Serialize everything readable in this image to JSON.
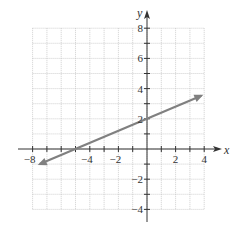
{
  "chart_data": {
    "type": "line",
    "title": "",
    "xlabel": "x",
    "ylabel": "y",
    "xlim": [
      -8,
      4
    ],
    "ylim": [
      -4,
      8
    ],
    "grid": true,
    "x_ticks": [
      -8,
      -4,
      -2,
      2,
      4
    ],
    "y_ticks": [
      8,
      6,
      4,
      2,
      -2,
      -4
    ],
    "series": [
      {
        "name": "line",
        "color": "#808080",
        "equation": "y = (2/5)x + 2",
        "points": [
          [
            -7.5,
            -1
          ],
          [
            -5,
            0
          ],
          [
            0,
            2
          ],
          [
            3.8,
            3.52
          ]
        ],
        "arrows": "both"
      }
    ]
  },
  "labels": {
    "x_axis": "x",
    "y_axis": "y",
    "x_tick_labels": [
      "−8",
      "−4",
      "−2",
      "2",
      "4"
    ],
    "y_tick_labels": [
      "8",
      "6",
      "4",
      "2",
      "−2",
      "−4"
    ]
  }
}
